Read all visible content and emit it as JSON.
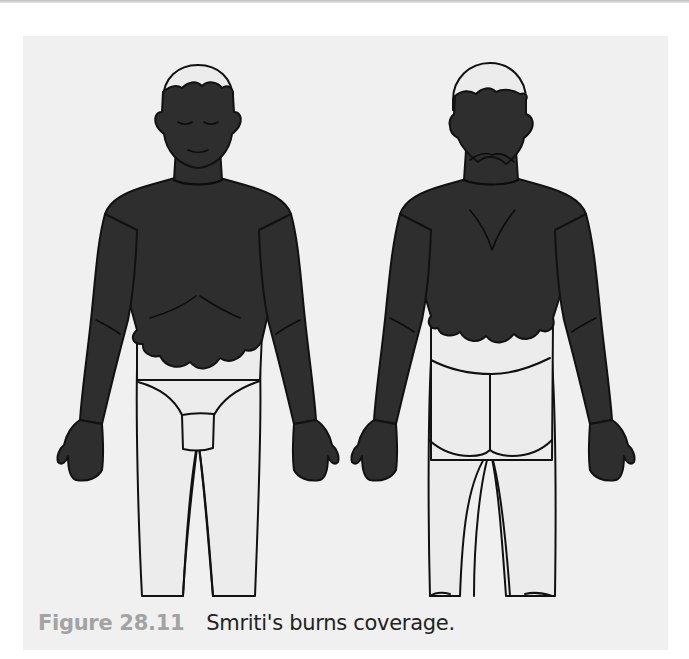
{
  "figure": {
    "number": "Figure 28.11",
    "caption": "Smriti's burns coverage.",
    "views": [
      {
        "id": "anterior",
        "label": "Front view"
      },
      {
        "id": "posterior",
        "label": "Back view"
      }
    ],
    "burned_regions": {
      "anterior": [
        "scalp (lower)",
        "face",
        "neck",
        "chest",
        "upper abdomen",
        "both arms",
        "both hands"
      ],
      "posterior": [
        "scalp (lower)",
        "back of head",
        "neck",
        "upper back",
        "both arms",
        "both hands"
      ]
    },
    "unburned_regions": {
      "anterior": [
        "crown of scalp",
        "lower abdomen",
        "groin",
        "legs"
      ],
      "posterior": [
        "crown of scalp",
        "lower back",
        "buttocks",
        "legs"
      ]
    },
    "colors": {
      "burn_fill": "#2e2e2e",
      "unburned_fill": "#ececec",
      "outline": "#111111",
      "panel_bg": "#f0f0f0",
      "figure_number": "#a3a3a3",
      "caption_text": "#222222"
    }
  }
}
